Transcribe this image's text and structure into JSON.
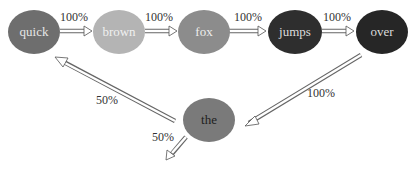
{
  "nodes": [
    {
      "id": "quick",
      "label": "quick",
      "color": "#6e6e6e",
      "text_color": "#e6e6e6"
    },
    {
      "id": "brown",
      "label": "brown",
      "color": "#b4b4b4",
      "text_color": "#f0f0f0"
    },
    {
      "id": "fox",
      "label": "fox",
      "color": "#8c8c8c",
      "text_color": "#eeeeee"
    },
    {
      "id": "jumps",
      "label": "jumps",
      "color": "#2e2e2e",
      "text_color": "#dcdcdc"
    },
    {
      "id": "over",
      "label": "over",
      "color": "#262626",
      "text_color": "#dcdcdc"
    },
    {
      "id": "the",
      "label": "the",
      "color": "#7a7a7a",
      "text_color": "#1e1e1e"
    }
  ],
  "edges": [
    {
      "from": "quick",
      "to": "brown",
      "label": "100%"
    },
    {
      "from": "brown",
      "to": "fox",
      "label": "100%"
    },
    {
      "from": "fox",
      "to": "jumps",
      "label": "100%"
    },
    {
      "from": "jumps",
      "to": "over",
      "label": "100%"
    },
    {
      "from": "over",
      "to": "the",
      "label": "100%"
    },
    {
      "from": "the",
      "to": "quick",
      "label": "50%"
    },
    {
      "from": "the",
      "to": "(exit)",
      "label": "50%"
    }
  ]
}
